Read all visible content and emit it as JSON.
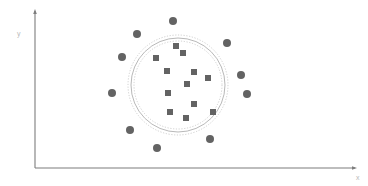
{
  "figure": {
    "width": 368,
    "height": 186,
    "background": "#ffffff"
  },
  "axes": {
    "x_label": "x",
    "y_label": "y",
    "label_color": "#b9b9b9",
    "axis_color": "#7d7d7d",
    "origin": {
      "x": 35,
      "y": 168
    },
    "x_end": {
      "x": 355,
      "y": 168
    },
    "y_end": {
      "x": 35,
      "y": 11
    },
    "arrow_heads": true
  },
  "chart_data": {
    "type": "scatter",
    "title": "",
    "xlabel": "x",
    "ylabel": "y",
    "grid": false,
    "legend": null,
    "xlim": [
      35,
      355
    ],
    "ylim": [
      11,
      168
    ],
    "annotations": [
      {
        "name": "outer-boundary-circle",
        "shape": "circle",
        "cx": 178,
        "cy": 85,
        "r": 50,
        "stroke": "#c9c9c9",
        "style": "dashed",
        "dash": "1.2,1.6",
        "stroke_width": 0.9
      },
      {
        "name": "middle-boundary-circle",
        "shape": "circle",
        "cx": 178,
        "cy": 85,
        "r": 47,
        "stroke": "#b0b0b0",
        "style": "solid",
        "stroke_width": 0.9
      },
      {
        "name": "inner-boundary-circle",
        "shape": "circle",
        "cx": 178,
        "cy": 85,
        "r": 44,
        "stroke": "#c9c9c9",
        "style": "dashed",
        "dash": "1.2,1.6",
        "stroke_width": 0.9
      }
    ],
    "series": [
      {
        "name": "inliers",
        "marker": "square",
        "color": "#636363",
        "size": 6,
        "points": [
          {
            "x": 176,
            "y": 46
          },
          {
            "x": 183,
            "y": 53
          },
          {
            "x": 156,
            "y": 58
          },
          {
            "x": 167,
            "y": 71
          },
          {
            "x": 194,
            "y": 72
          },
          {
            "x": 208,
            "y": 78
          },
          {
            "x": 187,
            "y": 84
          },
          {
            "x": 168,
            "y": 93
          },
          {
            "x": 194,
            "y": 104
          },
          {
            "x": 170,
            "y": 112
          },
          {
            "x": 213,
            "y": 112
          },
          {
            "x": 186,
            "y": 118
          }
        ]
      },
      {
        "name": "outliers",
        "marker": "circle",
        "color": "#636363",
        "size": 8,
        "points": [
          {
            "x": 173,
            "y": 21
          },
          {
            "x": 137,
            "y": 34
          },
          {
            "x": 227,
            "y": 43
          },
          {
            "x": 122,
            "y": 57
          },
          {
            "x": 241,
            "y": 75
          },
          {
            "x": 112,
            "y": 93
          },
          {
            "x": 247,
            "y": 94
          },
          {
            "x": 130,
            "y": 130
          },
          {
            "x": 210,
            "y": 139
          },
          {
            "x": 157,
            "y": 148
          }
        ]
      }
    ]
  }
}
